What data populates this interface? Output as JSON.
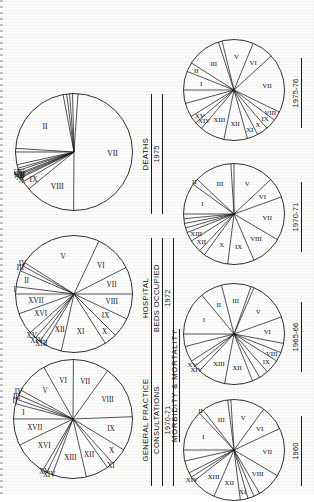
{
  "figure": {
    "group_label": "MORBIDITY & MORTALITY",
    "background_color": "#fdfdfc",
    "ink_color": "#141414"
  },
  "chart_data": [
    {
      "id": "gp-1970-71",
      "type": "pie",
      "title": "GENERAL PRACTICE",
      "subtitle": "CONSULTATIONS",
      "year": "1970-71",
      "start_angle": -90,
      "categories": [
        "I",
        "II",
        "III",
        "IV",
        "V",
        "VI",
        "VII",
        "VIII",
        "IX",
        "X",
        "XI",
        "XII",
        "XIII",
        "XIV",
        "XV",
        "XVI",
        "XVII"
      ],
      "values": [
        4.0,
        1.2,
        1.2,
        1.4,
        8.5,
        8.0,
        9.5,
        14.0,
        9.0,
        4.5,
        1.8,
        6.0,
        9.0,
        1.5,
        1.2,
        9.0,
        7.0
      ],
      "labels_shown": [
        "I",
        "II",
        "III",
        "IV",
        "V",
        "VI",
        "VII",
        "VIII",
        "IX",
        "X",
        "XI",
        "XII",
        "XIII",
        "XIV",
        "XV",
        "XVI",
        "XVII"
      ]
    },
    {
      "id": "hospital-1972",
      "type": "pie",
      "title": "HOSPITAL",
      "subtitle": "BEDS OCCUPIED",
      "year": "1972",
      "start_angle": -90,
      "categories": [
        "I",
        "II",
        "III",
        "IV",
        "V",
        "VI",
        "VII",
        "VIII",
        "IX",
        "X",
        "XI",
        "XII",
        "XIII",
        "XIV",
        "XV",
        "XVI",
        "XVII"
      ],
      "values": [
        2.0,
        4.5,
        1.5,
        1.0,
        23.0,
        10.5,
        7.5,
        7.0,
        5.5,
        3.5,
        12.5,
        5.0,
        1.5,
        1.5,
        2.0,
        6.0,
        5.5
      ],
      "labels_shown": [
        "I",
        "II",
        "III",
        "IV",
        "V",
        "VI",
        "VII",
        "VIII",
        "IX",
        "X",
        "XI",
        "XII",
        "XIII",
        "XIV",
        "XV",
        "XVI",
        "XVII"
      ]
    },
    {
      "id": "deaths-1975",
      "type": "pie",
      "title": "DEATHS",
      "subtitle": "",
      "year": "1975",
      "start_angle": -90,
      "categories": [
        "I",
        "II",
        "III",
        "IV",
        "V",
        "VI",
        "VII",
        "VIII",
        "IX",
        "X",
        "XI",
        "XII",
        "XIII",
        "XIV",
        "XV",
        "XVI",
        "XVII"
      ],
      "values": [
        1.0,
        21.0,
        1.0,
        0.8,
        0.8,
        1.5,
        49.0,
        14.0,
        2.5,
        1.2,
        0.4,
        0.5,
        0.4,
        0.8,
        0.6,
        1.0,
        3.5
      ],
      "labels_shown": [
        "II",
        "VII",
        "VIII",
        "IX",
        "X",
        "XI",
        "XII",
        "XIII",
        "XIV"
      ]
    },
    {
      "id": "mm-1960",
      "type": "pie",
      "title": "",
      "subtitle": "",
      "year": "1960",
      "start_angle": -90,
      "categories": [
        "I",
        "II",
        "III",
        "IV",
        "V",
        "VI",
        "VII",
        "VIII",
        "IX",
        "X",
        "XI",
        "XII",
        "XIII",
        "XIV",
        "XV",
        "XVI",
        "XVII"
      ],
      "values": [
        13.0,
        1.5,
        8.5,
        1.0,
        11.0,
        8.0,
        15.5,
        8.0,
        2.0,
        2.0,
        2.5,
        8.5,
        8.0,
        1.5,
        1.5,
        4.0,
        3.5
      ],
      "labels_shown": [
        "I",
        "II",
        "III",
        "V",
        "VI",
        "VII",
        "VIII",
        "XI",
        "XII",
        "XIII",
        "XIV"
      ]
    },
    {
      "id": "mm-1965-66",
      "type": "pie",
      "title": "",
      "subtitle": "",
      "year": "1965-66",
      "start_angle": -90,
      "categories": [
        "I",
        "II",
        "III",
        "IV",
        "V",
        "VI",
        "VII",
        "VIII",
        "IX",
        "X",
        "XI",
        "XII",
        "XIII",
        "XIV",
        "XV",
        "XVI",
        "XVII"
      ],
      "values": [
        14.0,
        7.0,
        9.5,
        1.0,
        13.0,
        8.5,
        3.0,
        3.0,
        4.5,
        3.0,
        2.5,
        9.0,
        9.0,
        2.0,
        2.0,
        5.0,
        4.0
      ],
      "labels_shown": [
        "I",
        "II",
        "III",
        "V",
        "VI",
        "VIII",
        "IX",
        "XII",
        "XIII",
        "XIV",
        "XV"
      ]
    },
    {
      "id": "mm-1970-71",
      "type": "pie",
      "title": "",
      "subtitle": "",
      "year": "1970-71",
      "start_angle": -90,
      "categories": [
        "I",
        "II",
        "III",
        "IV",
        "V",
        "VI",
        "VII",
        "VIII",
        "IX",
        "X",
        "XI",
        "XII",
        "XIII",
        "XIV",
        "XV",
        "XVI",
        "XVII"
      ],
      "values": [
        10.0,
        2.0,
        12.0,
        1.0,
        13.0,
        6.5,
        14.0,
        10.0,
        8.5,
        8.0,
        2.0,
        4.0,
        3.0,
        1.5,
        1.5,
        1.5,
        1.5
      ],
      "labels_shown": [
        "I",
        "II",
        "III",
        "V",
        "VI",
        "VII",
        "VIII",
        "IX",
        "X",
        "XII",
        "XIII"
      ]
    },
    {
      "id": "mm-1975-76",
      "type": "pie",
      "title": "",
      "subtitle": "",
      "year": "1975-76",
      "start_angle": -90,
      "categories": [
        "I",
        "II",
        "III",
        "IV",
        "V",
        "VI",
        "VII",
        "VIII",
        "IX",
        "X",
        "XI",
        "XII",
        "XIII",
        "XIV",
        "XV",
        "XVI",
        "XVII"
      ],
      "values": [
        6.0,
        3.0,
        11.0,
        1.2,
        10.0,
        7.0,
        19.0,
        3.0,
        3.5,
        3.5,
        3.5,
        7.5,
        8.0,
        2.5,
        2.5,
        4.5,
        4.3
      ],
      "labels_shown": [
        "I",
        "II",
        "III",
        "V",
        "VI",
        "VII",
        "VIII",
        "IX",
        "X",
        "XI",
        "XII",
        "XIII",
        "XIV",
        "XV"
      ]
    }
  ]
}
